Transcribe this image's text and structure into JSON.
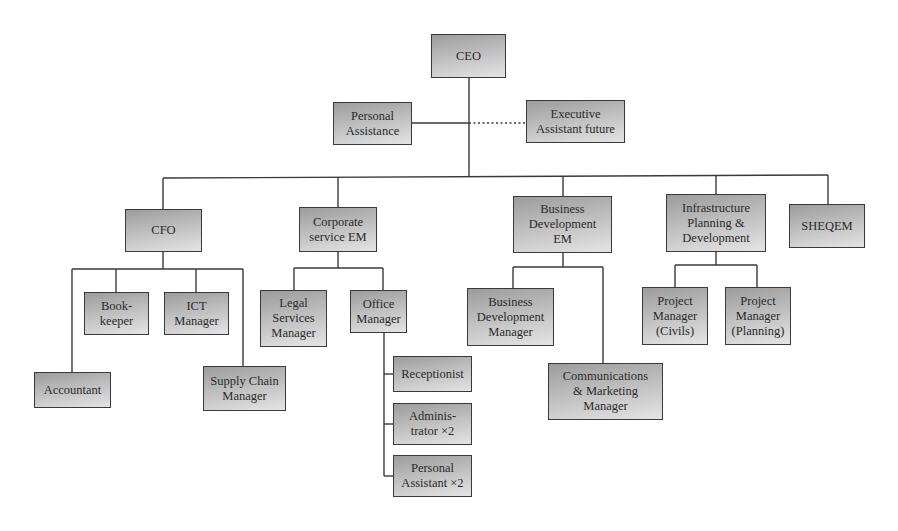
{
  "diagram": {
    "type": "org-chart",
    "colors": {
      "line": "#3a3a3a",
      "box_border": "#3a3a3a",
      "box_fill_top": "#9c9c9c",
      "box_fill_bottom": "#e4e4e4",
      "text": "#2a2a2a"
    },
    "nodes": [
      {
        "id": "ceo",
        "label": "CEO",
        "x": 431,
        "y": 34,
        "w": 75,
        "h": 44
      },
      {
        "id": "personal-assistance",
        "label": "Personal\nAssistance",
        "x": 333,
        "y": 102,
        "w": 79,
        "h": 43
      },
      {
        "id": "executive-assistant-future",
        "label": "Executive\nAssistant future",
        "x": 526,
        "y": 100,
        "w": 99,
        "h": 43
      },
      {
        "id": "cfo",
        "label": "CFO",
        "x": 125,
        "y": 209,
        "w": 77,
        "h": 43
      },
      {
        "id": "bookkeeper",
        "label": "Book-\nkeeper",
        "x": 84,
        "y": 292,
        "w": 65,
        "h": 43
      },
      {
        "id": "ict-manager",
        "label": "ICT\nManager",
        "x": 164,
        "y": 292,
        "w": 65,
        "h": 43
      },
      {
        "id": "accountant",
        "label": "Accountant",
        "x": 34,
        "y": 372,
        "w": 77,
        "h": 36
      },
      {
        "id": "supply-chain-manager",
        "label": "Supply Chain\nManager",
        "x": 203,
        "y": 366,
        "w": 83,
        "h": 45
      },
      {
        "id": "corporate-service-em",
        "label": "Corporate\nservice EM",
        "x": 299,
        "y": 207,
        "w": 78,
        "h": 45
      },
      {
        "id": "legal-services-manager",
        "label": "Legal\nServices\nManager",
        "x": 260,
        "y": 290,
        "w": 67,
        "h": 57
      },
      {
        "id": "office-manager",
        "label": "Office\nManager",
        "x": 350,
        "y": 290,
        "w": 57,
        "h": 43
      },
      {
        "id": "receptionist",
        "label": "Receptionist",
        "x": 393,
        "y": 356,
        "w": 79,
        "h": 36
      },
      {
        "id": "administrator-x2",
        "label": "Adminis-\ntrator ×2",
        "x": 393,
        "y": 403,
        "w": 79,
        "h": 42
      },
      {
        "id": "personal-assistant-x2",
        "label": "Personal\nAssistant ×2",
        "x": 393,
        "y": 455,
        "w": 79,
        "h": 42
      },
      {
        "id": "business-development-em",
        "label": "Business\nDevelopment\nEM",
        "x": 513,
        "y": 196,
        "w": 99,
        "h": 57
      },
      {
        "id": "business-development-manager",
        "label": "Business\nDevelopment\nManager",
        "x": 467,
        "y": 288,
        "w": 87,
        "h": 58
      },
      {
        "id": "communications-marketing-manager",
        "label": "Communications\n& Marketing\nManager",
        "x": 548,
        "y": 363,
        "w": 115,
        "h": 57
      },
      {
        "id": "infrastructure-planning-development",
        "label": "Infrastructure\nPlanning &\nDevelopment",
        "x": 666,
        "y": 194,
        "w": 100,
        "h": 58
      },
      {
        "id": "sheqem",
        "label": "SHEQEM",
        "x": 789,
        "y": 204,
        "w": 76,
        "h": 44
      },
      {
        "id": "project-manager-civils",
        "label": "Project\nManager\n(Civils)",
        "x": 642,
        "y": 287,
        "w": 66,
        "h": 58
      },
      {
        "id": "project-manager-planning",
        "label": "Project\nManager\n(Planning)",
        "x": 725,
        "y": 287,
        "w": 66,
        "h": 58
      }
    ],
    "edges": [
      {
        "from": "ceo",
        "to": [
          "cfo",
          "corporate-service-em",
          "business-development-em",
          "infrastructure-planning-development",
          "sheqem"
        ]
      },
      {
        "from": "ceo",
        "to": [
          "personal-assistance"
        ],
        "style": "solid"
      },
      {
        "from": "ceo",
        "to": [
          "executive-assistant-future"
        ],
        "style": "dotted"
      },
      {
        "from": "cfo",
        "to": [
          "accountant",
          "bookkeeper",
          "ict-manager",
          "supply-chain-manager"
        ]
      },
      {
        "from": "corporate-service-em",
        "to": [
          "legal-services-manager",
          "office-manager"
        ]
      },
      {
        "from": "office-manager",
        "to": [
          "receptionist",
          "administrator-x2",
          "personal-assistant-x2"
        ]
      },
      {
        "from": "business-development-em",
        "to": [
          "business-development-manager",
          "communications-marketing-manager"
        ]
      },
      {
        "from": "infrastructure-planning-development",
        "to": [
          "project-manager-civils",
          "project-manager-planning"
        ]
      }
    ],
    "lines": [
      {
        "x1": 469,
        "y1": 78,
        "x2": 469,
        "y2": 176,
        "style": "solid"
      },
      {
        "x1": 412,
        "y1": 123,
        "x2": 469,
        "y2": 123,
        "style": "solid"
      },
      {
        "x1": 469,
        "y1": 123,
        "x2": 526,
        "y2": 123,
        "style": "dotted"
      },
      {
        "x1": 163,
        "y1": 178,
        "x2": 828,
        "y2": 175,
        "style": "solid"
      },
      {
        "x1": 163,
        "y1": 178,
        "x2": 163,
        "y2": 209,
        "style": "solid"
      },
      {
        "x1": 338,
        "y1": 177,
        "x2": 338,
        "y2": 207,
        "style": "solid"
      },
      {
        "x1": 563,
        "y1": 176,
        "x2": 563,
        "y2": 196,
        "style": "solid"
      },
      {
        "x1": 716,
        "y1": 175,
        "x2": 716,
        "y2": 194,
        "style": "solid"
      },
      {
        "x1": 828,
        "y1": 175,
        "x2": 828,
        "y2": 204,
        "style": "solid"
      },
      {
        "x1": 163,
        "y1": 252,
        "x2": 163,
        "y2": 269,
        "style": "solid"
      },
      {
        "x1": 72,
        "y1": 269,
        "x2": 243,
        "y2": 269,
        "style": "solid"
      },
      {
        "x1": 72,
        "y1": 269,
        "x2": 72,
        "y2": 372,
        "style": "solid"
      },
      {
        "x1": 116,
        "y1": 269,
        "x2": 116,
        "y2": 292,
        "style": "solid"
      },
      {
        "x1": 196,
        "y1": 269,
        "x2": 196,
        "y2": 292,
        "style": "solid"
      },
      {
        "x1": 243,
        "y1": 269,
        "x2": 243,
        "y2": 366,
        "style": "solid"
      },
      {
        "x1": 338,
        "y1": 252,
        "x2": 338,
        "y2": 268,
        "style": "solid"
      },
      {
        "x1": 294,
        "y1": 268,
        "x2": 383,
        "y2": 268,
        "style": "solid"
      },
      {
        "x1": 294,
        "y1": 268,
        "x2": 294,
        "y2": 290,
        "style": "solid"
      },
      {
        "x1": 383,
        "y1": 268,
        "x2": 383,
        "y2": 290,
        "style": "solid"
      },
      {
        "x1": 384,
        "y1": 333,
        "x2": 384,
        "y2": 476,
        "style": "solid"
      },
      {
        "x1": 384,
        "y1": 374,
        "x2": 393,
        "y2": 374,
        "style": "solid"
      },
      {
        "x1": 384,
        "y1": 424,
        "x2": 393,
        "y2": 424,
        "style": "solid"
      },
      {
        "x1": 384,
        "y1": 476,
        "x2": 393,
        "y2": 476,
        "style": "solid"
      },
      {
        "x1": 563,
        "y1": 253,
        "x2": 563,
        "y2": 267,
        "style": "solid"
      },
      {
        "x1": 513,
        "y1": 267,
        "x2": 603,
        "y2": 267,
        "style": "solid"
      },
      {
        "x1": 513,
        "y1": 267,
        "x2": 513,
        "y2": 288,
        "style": "solid"
      },
      {
        "x1": 603,
        "y1": 267,
        "x2": 603,
        "y2": 363,
        "style": "solid"
      },
      {
        "x1": 716,
        "y1": 252,
        "x2": 716,
        "y2": 265,
        "style": "solid"
      },
      {
        "x1": 675,
        "y1": 265,
        "x2": 757,
        "y2": 265,
        "style": "solid"
      },
      {
        "x1": 675,
        "y1": 265,
        "x2": 675,
        "y2": 287,
        "style": "solid"
      },
      {
        "x1": 757,
        "y1": 265,
        "x2": 757,
        "y2": 287,
        "style": "solid"
      }
    ]
  }
}
